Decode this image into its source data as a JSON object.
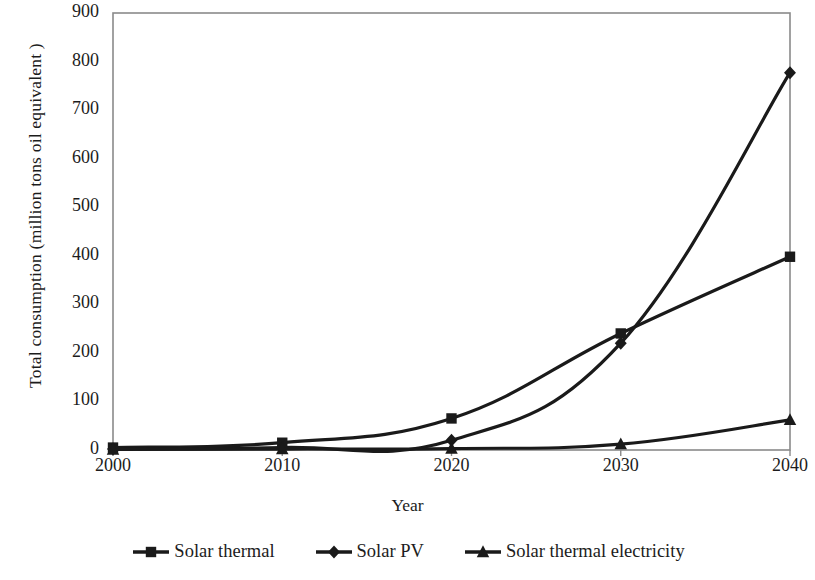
{
  "chart_data": {
    "type": "line",
    "title": "",
    "subtitle": "",
    "xlabel": "Year",
    "ylabel": "Total consumption (million tons oil   equivalent )",
    "x": [
      2000,
      2010,
      2020,
      2030,
      2040
    ],
    "xticklabels": [
      "2000",
      "2010",
      "2020",
      "2030",
      "2040"
    ],
    "yticklabels": [
      "0",
      "100",
      "200",
      "300",
      "400",
      "500",
      "600",
      "700",
      "800",
      "900"
    ],
    "yticks": [
      0,
      100,
      200,
      300,
      400,
      500,
      600,
      700,
      800,
      900
    ],
    "ylim": [
      0,
      900
    ],
    "xlim": [
      2000,
      2040
    ],
    "grid": false,
    "legend_position": "bottom",
    "series": [
      {
        "name": "Solar thermal",
        "marker": "square",
        "color": "#1a1a1a",
        "values": [
          5,
          15,
          65,
          240,
          398
        ]
      },
      {
        "name": "Solar PV",
        "marker": "diamond",
        "color": "#1a1a1a",
        "values": [
          2,
          5,
          20,
          220,
          777
        ]
      },
      {
        "name": "Solar thermal electricity",
        "marker": "triangle",
        "color": "#1a1a1a",
        "values": [
          1,
          2,
          3,
          12,
          62
        ]
      }
    ]
  },
  "legend": {
    "items": [
      {
        "label": "Solar thermal",
        "marker": "square-marker-icon"
      },
      {
        "label": "Solar PV",
        "marker": "diamond-marker-icon"
      },
      {
        "label": "Solar thermal electricity",
        "marker": "triangle-marker-icon"
      }
    ]
  },
  "colors": {
    "line": "#1a1a1a",
    "axis": "#8a8a8a",
    "text": "#1c1c1c",
    "background": "#ffffff"
  }
}
